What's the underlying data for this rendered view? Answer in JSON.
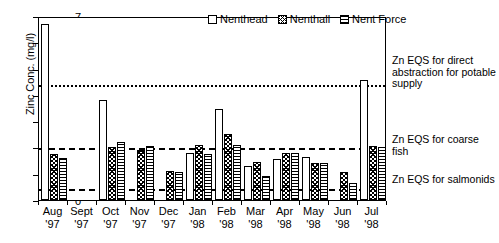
{
  "chart_data": {
    "type": "bar",
    "title": "",
    "xlabel": "",
    "ylabel": "Zinc Conc. (mg/l)",
    "ylim": [
      0,
      7
    ],
    "ytick_labels": [
      "0",
      "1",
      "2",
      "3",
      "4",
      "5",
      "6",
      "7"
    ],
    "ytick_values": [
      0,
      1,
      2,
      3,
      4,
      5,
      6,
      7
    ],
    "grid": false,
    "legend_position": "top-center",
    "categories": [
      "Aug '97",
      "Sept '97",
      "Oct '97",
      "Nov '97",
      "Dec '97",
      "Jan '98",
      "Feb '98",
      "Mar '98",
      "Apr '98",
      "May '98",
      "Jun '98",
      "Jul '98"
    ],
    "category_lines": [
      {
        "month": "Aug",
        "year": "'97"
      },
      {
        "month": "Sept",
        "year": "'97"
      },
      {
        "month": "Oct",
        "year": "'97"
      },
      {
        "month": "Nov",
        "year": "'97"
      },
      {
        "month": "Dec",
        "year": "'97"
      },
      {
        "month": "Jan",
        "year": "'98"
      },
      {
        "month": "Feb",
        "year": "'98"
      },
      {
        "month": "Mar",
        "year": "'98"
      },
      {
        "month": "Apr",
        "year": "'98"
      },
      {
        "month": "May",
        "year": "'98"
      },
      {
        "month": "Jun",
        "year": "'98"
      },
      {
        "month": "Jul",
        "year": "'98"
      }
    ],
    "series": [
      {
        "name": "Nenthead",
        "pattern": "nenthead",
        "values": [
          6.7,
          0,
          3.8,
          0,
          0,
          1.8,
          3.45,
          1.3,
          1.55,
          1.65,
          0,
          4.55
        ]
      },
      {
        "name": "Nenthall",
        "pattern": "nenthall",
        "values": [
          1.75,
          0,
          2.0,
          1.9,
          1.1,
          2.1,
          2.5,
          1.45,
          1.8,
          1.4,
          1.05,
          2.05
        ]
      },
      {
        "name": "Nent Force",
        "pattern": "nentforce",
        "values": [
          1.6,
          0,
          2.2,
          2.05,
          1.05,
          1.75,
          2.1,
          0.9,
          1.8,
          1.4,
          0.65,
          2.0
        ]
      }
    ],
    "threshold_lines": [
      {
        "label": "Zn EQS for direct abstraction for potable supply",
        "value": 4.45,
        "style": "dotted"
      },
      {
        "label": "Zn EQS for coarse fish",
        "value": 2.05,
        "style": "dashed"
      },
      {
        "label": "Zn EQS for salmonids",
        "value": 0.5,
        "style": "dashdot"
      }
    ],
    "annotations": [
      {
        "id": "potable",
        "text": "Zn EQS for direct abstraction for potable supply"
      },
      {
        "id": "coarse-fish",
        "text": "Zn EQS for coarse fish"
      },
      {
        "id": "salmonids",
        "text": "Zn EQS for salmonids"
      }
    ]
  }
}
